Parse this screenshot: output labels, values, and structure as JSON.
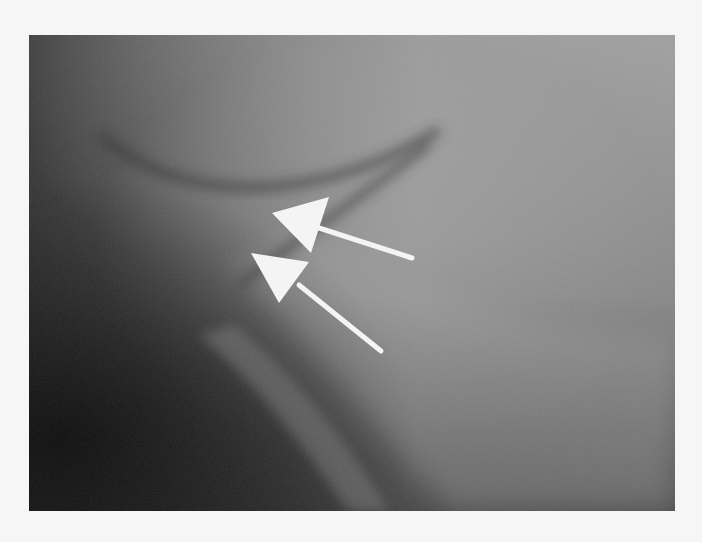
{
  "figure": {
    "kind": "radiograph",
    "description": "Grayscale X-ray image with two white arrows pointing up-left at a dark curved line",
    "colors": {
      "page_background": "#f6f6f6",
      "dark_tone": "#1e1e1e",
      "mid_tone": "#7a7a7a",
      "light_tone": "#a8a8a8",
      "arrow": "#f4f4f4"
    },
    "arrows": [
      {
        "name": "upper-arrow",
        "tip": [
          272,
          213
        ],
        "tail": [
          412,
          258
        ]
      },
      {
        "name": "lower-arrow",
        "tip": [
          251,
          253
        ],
        "tail": [
          381,
          351
        ]
      }
    ]
  }
}
